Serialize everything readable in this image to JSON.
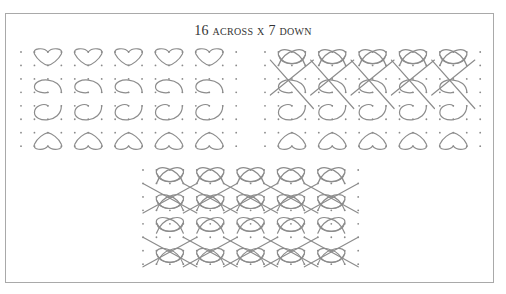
{
  "figure": {
    "title_num1": "16",
    "title_word1": "across",
    "title_x": "x",
    "title_num2": "7",
    "title_word2": "down"
  },
  "panels": [
    {
      "name": "panel-left",
      "description": "motif pieces",
      "origin": [
        21,
        52
      ],
      "cols": 17,
      "rows": 8
    },
    {
      "name": "panel-right",
      "description": "partially linked pattern",
      "origin": [
        265,
        52
      ],
      "cols": 17,
      "rows": 8
    },
    {
      "name": "panel-bottom",
      "description": "completed pattern",
      "origin": [
        143,
        170
      ],
      "cols": 17,
      "rows": 8
    }
  ],
  "grid": {
    "spacing": 13.45,
    "dot_color": "#8a8a8a",
    "line_color": "#8c8c8c"
  },
  "colors": {
    "frame": "#a9a9a9",
    "text": "#333333"
  }
}
